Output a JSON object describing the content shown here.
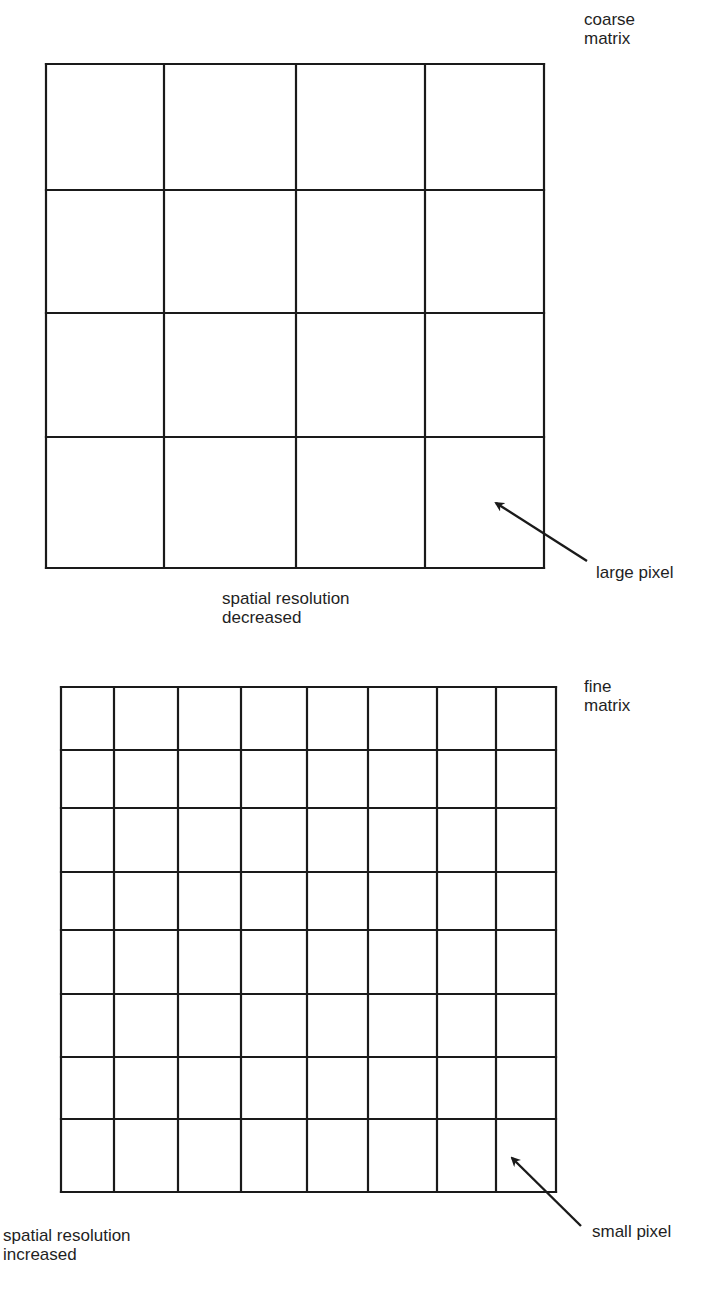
{
  "coarse": {
    "title_line1": "coarse",
    "title_line2": "matrix",
    "caption_line1": "spatial resolution",
    "caption_line2": "decreased",
    "pointer_label": "large pixel",
    "rows": 4,
    "cols": 4,
    "col_lines_x": [
      46,
      164,
      296,
      425,
      544
    ],
    "row_lines_y": [
      64,
      190,
      313,
      437,
      568
    ]
  },
  "fine": {
    "title_line1": "fine",
    "title_line2": "matrix",
    "caption_line1": "spatial resolution",
    "caption_line2": "increased",
    "pointer_label": "small pixel",
    "rows": 8,
    "cols": 8,
    "col_lines_x": [
      61,
      114,
      178,
      241,
      307,
      368,
      437,
      496,
      556
    ],
    "row_lines_y": [
      687,
      750,
      808,
      872,
      930,
      994,
      1057,
      1119,
      1192
    ]
  },
  "colors": {
    "line": "#1a1a1a",
    "background": "#ffffff"
  }
}
